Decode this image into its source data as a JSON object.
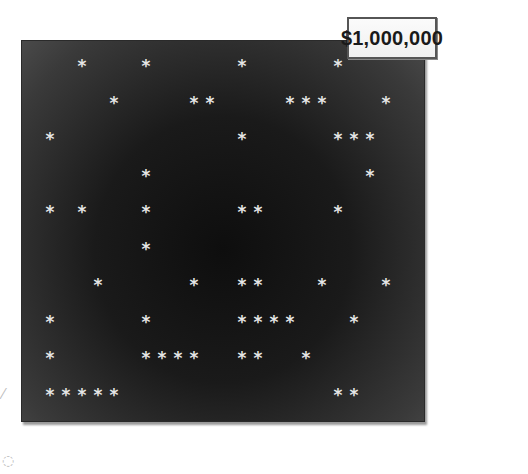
{
  "title_fragment": "",
  "prize": {
    "label": "$1,000,000"
  },
  "board": {
    "background_color": "#1a1a1a",
    "star_color": "#e6e6e6",
    "star_glyph": "*",
    "column_pitch_px": 16,
    "first_column_x_px": 28,
    "row_pitch_px": 36.5,
    "first_row_y_px": 15,
    "rows": [
      [
        2,
        6,
        12,
        18
      ],
      [
        4,
        9,
        10,
        15,
        16,
        17,
        21
      ],
      [
        0,
        12,
        18,
        19,
        20
      ],
      [
        6,
        20
      ],
      [
        0,
        2,
        6,
        12,
        13,
        18
      ],
      [
        6
      ],
      [
        3,
        9,
        12,
        13,
        17,
        21
      ],
      [
        0,
        6,
        12,
        13,
        14,
        15,
        19
      ],
      [
        0,
        6,
        7,
        8,
        9,
        12,
        13,
        16
      ],
      [
        0,
        1,
        2,
        3,
        4,
        18,
        19
      ]
    ]
  }
}
